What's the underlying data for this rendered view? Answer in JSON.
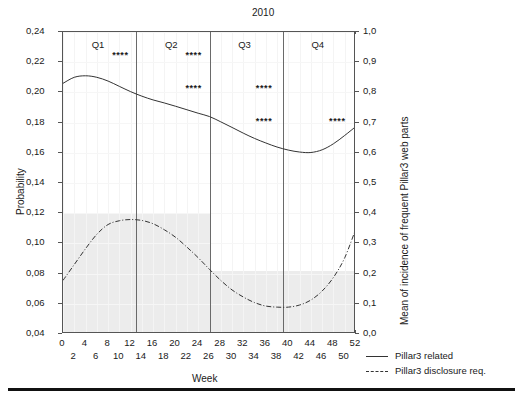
{
  "chart_data": {
    "type": "line",
    "title": "2010",
    "xlabel": "Week",
    "ylabel": "Probability",
    "y2label": "Mean of incidence of frequent Pillar3 web parts",
    "xlim": [
      0,
      52
    ],
    "ylim": [
      0.04,
      0.24
    ],
    "y2lim": [
      0.0,
      1.0
    ],
    "grid": true,
    "legend_position": "bottom-right",
    "x_ticks_top": [
      "0",
      "4",
      "8",
      "12",
      "16",
      "20",
      "24",
      "28",
      "32",
      "36",
      "40",
      "44",
      "48",
      "52"
    ],
    "x_ticks_bottom": [
      "2",
      "6",
      "10",
      "14",
      "18",
      "22",
      "26",
      "30",
      "34",
      "38",
      "42",
      "46",
      "50"
    ],
    "y_ticks": [
      "0,04",
      "0,06",
      "0,08",
      "0,10",
      "0,12",
      "0,14",
      "0,16",
      "0,18",
      "0,20",
      "0,22",
      "0,24"
    ],
    "y2_ticks": [
      "0,0",
      "0,1",
      "0,2",
      "0,3",
      "0,4",
      "0,5",
      "0,6",
      "0,7",
      "0,8",
      "0,9",
      "1,0"
    ],
    "quarters": [
      {
        "label": "Q1",
        "start": 0,
        "end": 13
      },
      {
        "label": "Q2",
        "start": 13,
        "end": 26
      },
      {
        "label": "Q3",
        "start": 26,
        "end": 39
      },
      {
        "label": "Q4",
        "start": 39,
        "end": 52
      }
    ],
    "quarter_boundaries": [
      13,
      26,
      39
    ],
    "series": [
      {
        "name": "Pillar3 related",
        "style": "solid",
        "axis": "left",
        "x": [
          0,
          2,
          4,
          6,
          8,
          10,
          12,
          14,
          16,
          18,
          20,
          22,
          24,
          26,
          28,
          30,
          32,
          34,
          36,
          38,
          40,
          42,
          44,
          46,
          48,
          50,
          52
        ],
        "values": [
          0.206,
          0.21,
          0.211,
          0.21,
          0.2075,
          0.204,
          0.2005,
          0.1975,
          0.195,
          0.193,
          0.1908,
          0.1885,
          0.1862,
          0.184,
          0.1805,
          0.1768,
          0.173,
          0.1695,
          0.1665,
          0.1638,
          0.1618,
          0.1605,
          0.1602,
          0.162,
          0.166,
          0.1715,
          0.1775
        ]
      },
      {
        "name": "Pillar3 disclosure req.",
        "style": "dashdot",
        "axis": "left",
        "x": [
          0,
          2,
          4,
          6,
          8,
          10,
          12,
          14,
          16,
          18,
          20,
          22,
          24,
          26,
          28,
          30,
          32,
          34,
          36,
          38,
          40,
          42,
          44,
          46,
          48,
          50,
          52
        ],
        "values": [
          0.0755,
          0.086,
          0.0965,
          0.106,
          0.1125,
          0.115,
          0.1158,
          0.1152,
          0.113,
          0.109,
          0.104,
          0.0975,
          0.0905,
          0.0828,
          0.0755,
          0.0692,
          0.0645,
          0.0608,
          0.0585,
          0.0578,
          0.0578,
          0.0592,
          0.0625,
          0.0685,
          0.0775,
          0.0905,
          0.11
        ]
      }
    ],
    "shaded_bands": [
      {
        "x_start": 0,
        "x_end": 26,
        "y_top": 0.12,
        "y_bottom": 0.04,
        "color": "#ececec"
      },
      {
        "x_start": 26,
        "x_end": 52,
        "y_top": 0.082,
        "y_bottom": 0.04,
        "color": "#ececec"
      }
    ],
    "significance_markers": [
      {
        "label": "****",
        "x": 10.5,
        "y": 0.2245
      },
      {
        "label": "****",
        "x": 23.5,
        "y": 0.2245
      },
      {
        "label": "****",
        "x": 23.5,
        "y": 0.203
      },
      {
        "label": "****",
        "x": 36.0,
        "y": 0.203
      },
      {
        "label": "****",
        "x": 36.0,
        "y": 0.181
      },
      {
        "label": "****",
        "x": 49.0,
        "y": 0.181
      }
    ]
  },
  "legend": {
    "items": [
      {
        "label": "Pillar3 related",
        "style": "solid"
      },
      {
        "label": "Pillar3 disclosure req.",
        "style": "dashdot"
      }
    ]
  }
}
